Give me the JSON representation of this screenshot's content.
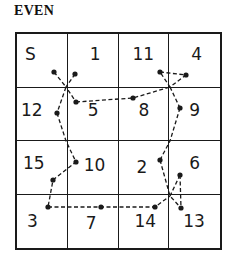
{
  "title": "EVEN",
  "grid": {
    "rows": 4,
    "cols": 4,
    "cells": [
      {
        "label": "S",
        "nx": 8,
        "ny": 10
      },
      {
        "label": "1",
        "nx": 22,
        "ny": 10
      },
      {
        "label": "11",
        "nx": 14,
        "ny": 10
      },
      {
        "label": "4",
        "nx": 22,
        "ny": 10
      },
      {
        "label": "12",
        "nx": 4,
        "ny": 12
      },
      {
        "label": "5",
        "nx": 20,
        "ny": 12
      },
      {
        "label": "8",
        "nx": 20,
        "ny": 12
      },
      {
        "label": "9",
        "nx": 20,
        "ny": 12
      },
      {
        "label": "15",
        "nx": 6,
        "ny": 12
      },
      {
        "label": "10",
        "nx": 16,
        "ny": 14
      },
      {
        "label": "2",
        "nx": 18,
        "ny": 16
      },
      {
        "label": "6",
        "nx": 20,
        "ny": 12
      },
      {
        "label": "3",
        "nx": 10,
        "ny": 16
      },
      {
        "label": "7",
        "nx": 18,
        "ny": 18
      },
      {
        "label": "14",
        "nx": 16,
        "ny": 16
      },
      {
        "label": "13",
        "nx": 14,
        "ny": 16
      }
    ]
  },
  "path": {
    "color": "#1a1a1a",
    "dots": [
      {
        "x": 54,
        "y": 72
      },
      {
        "x": 75,
        "y": 74
      },
      {
        "x": 160,
        "y": 72
      },
      {
        "x": 186,
        "y": 75
      },
      {
        "x": 57,
        "y": 113
      },
      {
        "x": 76,
        "y": 102
      },
      {
        "x": 133,
        "y": 98
      },
      {
        "x": 180,
        "y": 108
      },
      {
        "x": 53,
        "y": 180
      },
      {
        "x": 76,
        "y": 162
      },
      {
        "x": 160,
        "y": 160
      },
      {
        "x": 180,
        "y": 175
      },
      {
        "x": 48,
        "y": 207
      },
      {
        "x": 101,
        "y": 207
      },
      {
        "x": 155,
        "y": 207
      },
      {
        "x": 181,
        "y": 208
      }
    ]
  }
}
